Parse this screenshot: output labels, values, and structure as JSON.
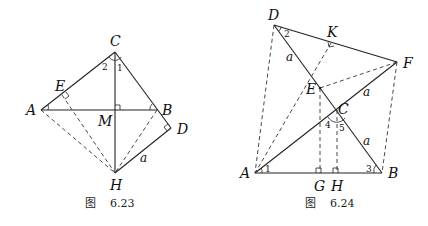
{
  "figures": [
    {
      "caption_prefix": "图",
      "caption_number": "6.23",
      "points": {
        "A": "A",
        "B": "B",
        "C": "C",
        "D": "D",
        "E": "E",
        "H": "H",
        "M": "M"
      },
      "angle_labels": {
        "angle1": "1",
        "angle2": "2"
      },
      "segment_label": "a"
    },
    {
      "caption_prefix": "图",
      "caption_number": "6.24",
      "points": {
        "A": "A",
        "B": "B",
        "C": "C",
        "D": "D",
        "E": "E",
        "F": "F",
        "G": "G",
        "H": "H",
        "K": "K"
      },
      "angle_labels": {
        "angle1": "1",
        "angle2": "2",
        "angle3": "3",
        "angle4": "4",
        "angle5": "5"
      },
      "segment_labels": {
        "DE": "a",
        "CF": "a",
        "CB": "a"
      }
    }
  ]
}
